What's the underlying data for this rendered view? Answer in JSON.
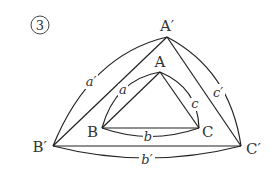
{
  "figure_number": "3",
  "outer_triangle": {
    "vertices": {
      "top": "A′",
      "left": "B′",
      "right": "C′"
    },
    "sides": {
      "left": "a′",
      "bottom": "b′",
      "right": "c′"
    }
  },
  "inner_triangle": {
    "vertices": {
      "top": "A",
      "left": "B",
      "right": "C"
    },
    "sides": {
      "left": "a",
      "bottom": "b",
      "right": "c"
    }
  }
}
